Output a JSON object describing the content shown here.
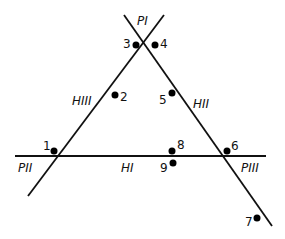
{
  "diagram": {
    "type": "triangle-of-lines",
    "line_color": "#111111",
    "dot_color": "#000000",
    "vertices": [
      {
        "id": "PI",
        "label": "P I",
        "x": 138,
        "y": 47
      },
      {
        "id": "PII",
        "label": "P II",
        "x": 55,
        "y": 156
      },
      {
        "id": "PIII",
        "label": "P III",
        "x": 222,
        "y": 156
      }
    ],
    "lines": [
      {
        "id": "HI",
        "label": "H I",
        "x1": 15,
        "y1": 156,
        "x2": 266,
        "y2": 156
      },
      {
        "id": "HII",
        "label": "H II",
        "x1": 124,
        "y1": 15,
        "x2": 272,
        "y2": 226
      },
      {
        "id": "HIII",
        "label": "H III",
        "x1": 164,
        "y1": 15,
        "x2": 28,
        "y2": 196
      }
    ],
    "labels": {
      "p1": "PI",
      "p2": "PII",
      "p3": "PIII",
      "h1": "HI",
      "h2": "HII",
      "h3": "HIII"
    },
    "points": [
      {
        "label": "1",
        "x": 54,
        "y": 151
      },
      {
        "label": "2",
        "x": 115,
        "y": 95
      },
      {
        "label": "3",
        "x": 136,
        "y": 45
      },
      {
        "label": "4",
        "x": 155,
        "y": 45
      },
      {
        "label": "5",
        "x": 172,
        "y": 93
      },
      {
        "label": "6",
        "x": 227,
        "y": 151
      },
      {
        "label": "7",
        "x": 257,
        "y": 218
      },
      {
        "label": "8",
        "x": 172,
        "y": 151
      },
      {
        "label": "9",
        "x": 173,
        "y": 163
      }
    ]
  }
}
